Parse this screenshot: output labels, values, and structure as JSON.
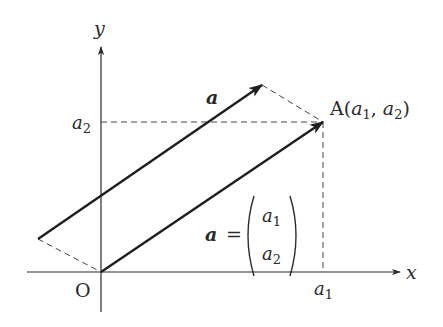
{
  "diagram": {
    "type": "vector-component-diagram",
    "axes": {
      "x_label": "x",
      "y_label": "y",
      "origin_label": "O",
      "x_tick_label": "a",
      "x_tick_sub": "1",
      "y_tick_label": "a",
      "y_tick_sub": "2"
    },
    "point": {
      "name": "A",
      "coords_text_prefix": "A(",
      "coord1": "a",
      "coord1_sub": "1",
      "sep": ", ",
      "coord2": "a",
      "coord2_sub": "2",
      "suffix": ")"
    },
    "vectors": [
      {
        "name": "free-vector-a",
        "label": "a",
        "from": [
          38,
          239
        ],
        "to": [
          262,
          85
        ]
      },
      {
        "name": "position-vector-a",
        "label": "a",
        "from": [
          101,
          272
        ],
        "to": [
          323,
          122
        ]
      }
    ],
    "equation": {
      "lhs": "a",
      "eq": "=",
      "top": "a",
      "top_sub": "1",
      "bottom": "a",
      "bottom_sub": "2"
    },
    "colors": {
      "line": "#2a2a2a",
      "dash": "#444444"
    }
  }
}
